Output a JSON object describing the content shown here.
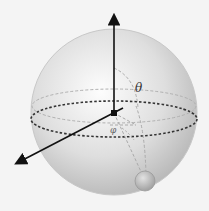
{
  "diagram": {
    "labels": {
      "theta": "θ",
      "phi": "φ"
    },
    "colors": {
      "background": "#f4f4f4",
      "sphere_light": "#fbfbfb",
      "sphere_dark": "#bdbdbd",
      "axis": "#111111",
      "dashed": "#a8a8a8",
      "equator": "#222222",
      "point": "#b5b5b5"
    }
  }
}
